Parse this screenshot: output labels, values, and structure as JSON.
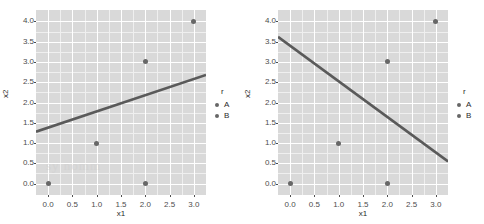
{
  "chart_data": [
    {
      "type": "scatter",
      "panel": "left",
      "title": "",
      "xlabel": "x1",
      "ylabel": "x2",
      "xlim": [
        -0.25,
        3.25
      ],
      "ylim": [
        -0.28,
        4.28
      ],
      "xticks": [
        "0.0",
        "0.5",
        "1.0",
        "1.5",
        "2.0",
        "2.5",
        "3.0"
      ],
      "xtick_values": [
        0.0,
        0.5,
        1.0,
        1.5,
        2.0,
        2.5,
        3.0
      ],
      "yticks": [
        "0.0",
        "0.5",
        "1.0",
        "1.5",
        "2.0",
        "2.5",
        "3.0",
        "3.5",
        "4.0"
      ],
      "ytick_values": [
        0.0,
        0.5,
        1.0,
        1.5,
        2.0,
        2.5,
        3.0,
        3.5,
        4.0
      ],
      "grid": true,
      "points": [
        {
          "x": 0.0,
          "y": 0.0
        },
        {
          "x": 1.0,
          "y": 1.0
        },
        {
          "x": 2.0,
          "y": 0.0
        },
        {
          "x": 2.0,
          "y": 3.0
        },
        {
          "x": 3.0,
          "y": 4.0
        }
      ],
      "line": {
        "x0": -0.25,
        "y0": 1.28,
        "x1": 3.25,
        "y1": 2.68,
        "color": "#5a5a5a"
      },
      "legend": {
        "title": "r",
        "position": "right",
        "items": [
          {
            "label": "A",
            "color": "#676767"
          },
          {
            "label": "B",
            "color": "#676767"
          }
        ]
      }
    },
    {
      "type": "scatter",
      "panel": "right",
      "title": "",
      "xlabel": "x1",
      "ylabel": "x2",
      "xlim": [
        -0.25,
        3.25
      ],
      "ylim": [
        -0.28,
        4.28
      ],
      "xticks": [
        "0.0",
        "0.5",
        "1.0",
        "1.5",
        "2.0",
        "2.5",
        "3.0"
      ],
      "xtick_values": [
        0.0,
        0.5,
        1.0,
        1.5,
        2.0,
        2.5,
        3.0
      ],
      "yticks": [
        "0.0",
        "0.5",
        "1.0",
        "1.5",
        "2.0",
        "2.5",
        "3.0",
        "3.5",
        "4.0"
      ],
      "ytick_values": [
        0.0,
        0.5,
        1.0,
        1.5,
        2.0,
        2.5,
        3.0,
        3.5,
        4.0
      ],
      "grid": true,
      "points": [
        {
          "x": 0.0,
          "y": 0.0
        },
        {
          "x": 1.0,
          "y": 1.0
        },
        {
          "x": 2.0,
          "y": 0.0
        },
        {
          "x": 2.0,
          "y": 3.0
        },
        {
          "x": 3.0,
          "y": 4.0
        }
      ],
      "line": {
        "x0": -0.25,
        "y0": 3.62,
        "x1": 3.25,
        "y1": 0.55,
        "color": "#5a5a5a"
      },
      "legend": {
        "title": "r",
        "position": "right",
        "items": [
          {
            "label": "A",
            "color": "#676767"
          },
          {
            "label": "B",
            "color": "#676767"
          }
        ]
      }
    }
  ],
  "style": {
    "panel_background": "#d9d9d9",
    "grid_major_color": "#ffffff",
    "grid_minor_color": "#efefef",
    "point_color": "#676767",
    "line_color": "#5a5a5a",
    "text_color": "#2b2b2b",
    "tick_color": "#4d4d4d",
    "figure_background": "#ffffff"
  },
  "watermark": {
    "text": "sy nomm"
  }
}
